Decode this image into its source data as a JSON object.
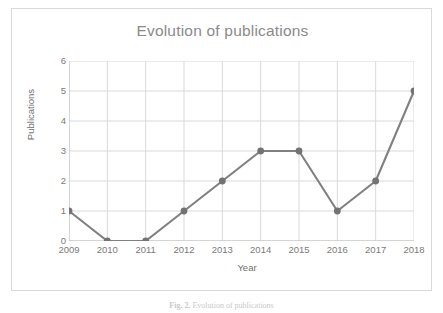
{
  "figure": {
    "caption_label": "Fig. 2.",
    "caption_text": "Evolution of publications"
  },
  "chart_data": {
    "type": "line",
    "title": "Evolution of publications",
    "xlabel": "Year",
    "ylabel": "Publications",
    "categories": [
      "2009",
      "2010",
      "2011",
      "2012",
      "2013",
      "2014",
      "2015",
      "2016",
      "2017",
      "2018"
    ],
    "values": [
      1,
      0,
      0,
      1,
      2,
      3,
      3,
      1,
      2,
      5
    ],
    "ylim": [
      0,
      6
    ],
    "yticks": [
      "0",
      "1",
      "2",
      "3",
      "4",
      "5",
      "6"
    ],
    "grid": true,
    "legend": "none",
    "series_color": "#808080",
    "marker_color": "#737373",
    "grid_color": "#d9d9d9",
    "axis_color": "#bfbfbf",
    "title_color": "#8a8a8a",
    "tick_label_color": "#7a7a7a"
  }
}
